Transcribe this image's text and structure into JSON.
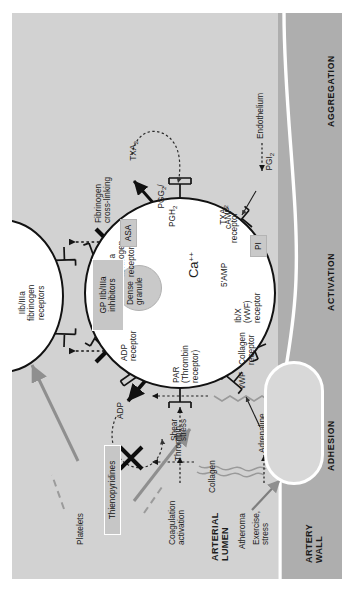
{
  "figure": {
    "caption_partial": "FIGURE 10.2",
    "regions": {
      "artery_wall": "ARTERY\nWALL",
      "arterial_lumen": "ARTERIAL\nLUMEN",
      "endothelium": "Endothelium",
      "atheroma": "Atheroma"
    },
    "phases": [
      {
        "id": "adhesion",
        "label": "ADHESION"
      },
      {
        "id": "activation",
        "label": "ACTIVATION"
      },
      {
        "id": "aggregation",
        "label": "AGGREGATION"
      }
    ],
    "adhesion": {
      "collagen": "Collagen",
      "vwf": "vWF",
      "shear_stress": "Shear\nstress"
    },
    "stimuli": [
      {
        "source": "Exercise,\nstress",
        "mediator": "Adrenaline"
      },
      {
        "source": "Coagulation\nactivation",
        "mediator": "Thrombin"
      },
      {
        "source": "Endothelium",
        "mediator": "PGI",
        "mediator_sub": "2"
      }
    ],
    "receptors": [
      {
        "name": "PAR\n(Thrombin\nreceptor)"
      },
      {
        "name": "ADP\nreceptor"
      },
      {
        "name": "Collagen\nreceptor"
      },
      {
        "name": "Ib/X\n(vWF)\nreceptor"
      },
      {
        "name": "TXA",
        "name_sub": "2",
        "name_tail": "\nreceptor"
      },
      {
        "name": "IIb/IIIa\nfibrinogen\nreceptors"
      }
    ],
    "platelet_interior": {
      "calcium": "Ca",
      "calcium_sup": "++",
      "dense_granule": "Dense\ngranule",
      "fibrinogen_receptors": "IIb/IIIa\nfibrinogen\nreceptors",
      "camp": "cAMP",
      "amp5": "5'AMP",
      "prostaglandins": "PGG",
      "prostaglandins_sub1": "2",
      "prostaglandins_mid": "/\nPGH",
      "prostaglandins_sub2": "2",
      "txa2_out": "TXA",
      "txa2_out_sub": "2"
    },
    "aggregation": {
      "adp": "ADP",
      "platelets": "Platelets",
      "fibrinogen_crosslinking": "Fibrinogen\ncross-linking",
      "upper_platelet_receptors": "IIb/IIIa\nfibrinogen\nreceptors"
    },
    "drugs": [
      {
        "id": "thienopyridines",
        "label": "Thienopyridines",
        "style": "white-outline"
      },
      {
        "id": "gp-iibiiia",
        "label": "GP IIb/IIIa\ninhibitors",
        "style": "white-outline"
      },
      {
        "id": "asa",
        "label": "ASA",
        "style": "grey"
      },
      {
        "id": "pi",
        "label": "PI",
        "style": "grey"
      }
    ],
    "colors": {
      "lumen": "#d2d2d2",
      "wall": "#aeaeae",
      "platelet_fill": "#ffffff",
      "platelet_stroke": "#121212",
      "granule": "#c9c9c9",
      "grey_arrow": "#8f8f8f",
      "text": "#1b1b1b"
    }
  }
}
